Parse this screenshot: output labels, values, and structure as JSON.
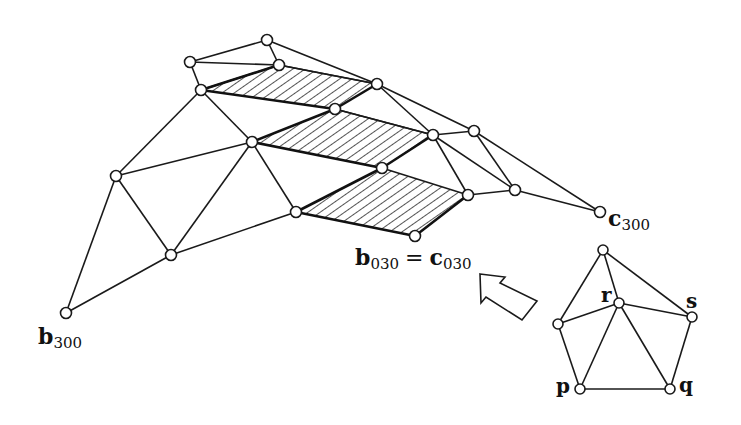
{
  "figure": {
    "labels": {
      "b300": {
        "base": "b",
        "sub": "300"
      },
      "c300": {
        "base": "c",
        "sub": "300"
      },
      "b030_eq": {
        "lhs_base": "b",
        "lhs_sub": "030",
        "op": "=",
        "rhs_base": "c",
        "rhs_sub": "030"
      }
    },
    "inset_labels": {
      "p": "p",
      "q": "q",
      "r": "r",
      "s": "s"
    },
    "colors": {
      "stroke": "#1a1a1a",
      "background": "#ffffff",
      "node_fill": "#ffffff"
    },
    "main_nodes": [
      {
        "id": "n1",
        "x": 267,
        "y": 40
      },
      {
        "id": "n2",
        "x": 190,
        "y": 62
      },
      {
        "id": "n3",
        "x": 279,
        "y": 65
      },
      {
        "id": "n4",
        "x": 201,
        "y": 90
      },
      {
        "id": "n5",
        "x": 377,
        "y": 84
      },
      {
        "id": "n6",
        "x": 335,
        "y": 109
      },
      {
        "id": "n7",
        "x": 252,
        "y": 142
      },
      {
        "id": "n8",
        "x": 433,
        "y": 135
      },
      {
        "id": "n9",
        "x": 474,
        "y": 131
      },
      {
        "id": "n10",
        "x": 382,
        "y": 168
      },
      {
        "id": "n11",
        "x": 116,
        "y": 176
      },
      {
        "id": "n12",
        "x": 468,
        "y": 195
      },
      {
        "id": "n13",
        "x": 515,
        "y": 190
      },
      {
        "id": "n14",
        "x": 296,
        "y": 212
      },
      {
        "id": "n15",
        "x": 415,
        "y": 236
      },
      {
        "id": "c300",
        "x": 600,
        "y": 212
      },
      {
        "id": "n16",
        "x": 171,
        "y": 255
      },
      {
        "id": "b300",
        "x": 66,
        "y": 313
      }
    ],
    "shaded_quads": 3,
    "inset_nodes": [
      {
        "id": "top",
        "x": 603,
        "y": 250
      },
      {
        "id": "r",
        "x": 619,
        "y": 303
      },
      {
        "id": "s",
        "x": 692,
        "y": 317
      },
      {
        "id": "left",
        "x": 558,
        "y": 324
      },
      {
        "id": "p",
        "x": 580,
        "y": 389
      },
      {
        "id": "q",
        "x": 670,
        "y": 389
      }
    ]
  }
}
